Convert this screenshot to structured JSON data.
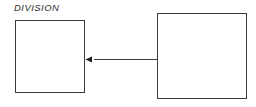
{
  "diagram": {
    "title": "DIVISION",
    "background_color": "#ffffff",
    "stroke_color": "#3a3a3a",
    "arrow_color": "#1c1c1c",
    "nodes": [
      {
        "id": "left",
        "label": "",
        "x": 15,
        "y": 20,
        "width": 70,
        "height": 73,
        "shape": "rectangle",
        "fill": "#ffffff"
      },
      {
        "id": "right",
        "label": "",
        "x": 157,
        "y": 13,
        "width": 90,
        "height": 86,
        "shape": "rectangle",
        "fill": "#ffffff"
      }
    ],
    "connectors": [
      {
        "id": "right-to-left",
        "from": "right",
        "to": "left",
        "label": "",
        "direction": "left",
        "arrowhead": "solid-triangle",
        "x1": 157,
        "y1": 59,
        "x2": 86,
        "y2": 59
      }
    ]
  }
}
